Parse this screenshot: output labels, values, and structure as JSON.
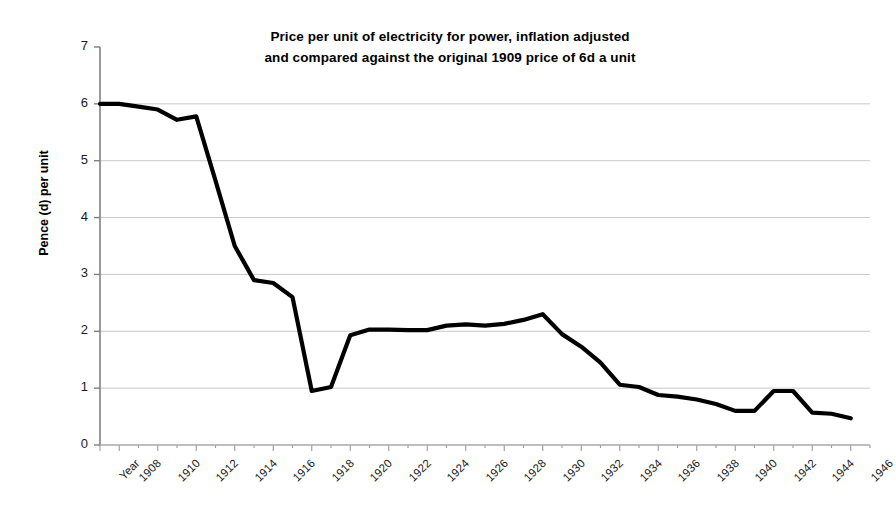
{
  "chart_data": {
    "type": "line",
    "title": "Price per unit of electricity for power, inflation adjusted and compared against the original 1909 price of 6d a unit",
    "title_line1": "Price per unit of electricity for power, inflation adjusted",
    "title_line2": "and compared against the original 1909 price of 6d a unit",
    "xlabel": "",
    "ylabel": "Pence (d) per unit",
    "ylim": [
      0,
      7
    ],
    "xlim": [
      1907,
      1947
    ],
    "grid": true,
    "legend": false,
    "line_color": "#000000",
    "grid_color": "#c8c8c8",
    "axis_color": "#808080",
    "ytick_labels": [
      "0",
      "1",
      "2",
      "3",
      "4",
      "5",
      "6",
      "7"
    ],
    "ytick_values": [
      0,
      1,
      2,
      3,
      4,
      5,
      6,
      7
    ],
    "xtick_labels": [
      "Year",
      "1908",
      "1910",
      "1912",
      "1914",
      "1916",
      "1918",
      "1920",
      "1922",
      "1924",
      "1926",
      "1928",
      "1930",
      "1932",
      "1934",
      "1936",
      "1938",
      "1940",
      "1942",
      "1944",
      "1946"
    ],
    "xtick_values": [
      1907,
      1908,
      1910,
      1912,
      1914,
      1916,
      1918,
      1920,
      1922,
      1924,
      1926,
      1928,
      1930,
      1932,
      1934,
      1936,
      1938,
      1940,
      1942,
      1944,
      1946
    ],
    "x": [
      1907,
      1908,
      1909,
      1910,
      1911,
      1912,
      1913,
      1914,
      1915,
      1916,
      1917,
      1918,
      1919,
      1920,
      1921,
      1922,
      1923,
      1924,
      1925,
      1926,
      1927,
      1928,
      1929,
      1930,
      1931,
      1932,
      1933,
      1934,
      1935,
      1936,
      1937,
      1938,
      1939,
      1940,
      1941,
      1942,
      1943,
      1944,
      1945,
      1946
    ],
    "values": [
      6.0,
      6.0,
      5.95,
      5.9,
      5.72,
      5.78,
      4.65,
      3.5,
      2.9,
      2.85,
      2.6,
      0.95,
      1.02,
      1.93,
      2.03,
      2.03,
      2.02,
      2.02,
      2.1,
      2.12,
      2.1,
      2.13,
      2.2,
      2.3,
      1.95,
      1.73,
      1.45,
      1.06,
      1.02,
      0.88,
      0.85,
      0.8,
      0.72,
      0.6,
      0.6,
      0.95,
      0.95,
      0.57,
      0.55,
      0.47
    ],
    "series": [
      {
        "name": "Price per unit (d)",
        "values": [
          6.0,
          6.0,
          5.95,
          5.9,
          5.72,
          5.78,
          4.65,
          3.5,
          2.9,
          2.85,
          2.6,
          0.95,
          1.02,
          1.93,
          2.03,
          2.03,
          2.02,
          2.02,
          2.1,
          2.12,
          2.1,
          2.13,
          2.2,
          2.3,
          1.95,
          1.73,
          1.45,
          1.06,
          1.02,
          0.88,
          0.85,
          0.8,
          0.72,
          0.6,
          0.6,
          0.95,
          0.95,
          0.57,
          0.55,
          0.47
        ]
      }
    ]
  }
}
